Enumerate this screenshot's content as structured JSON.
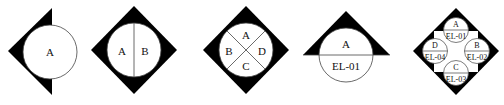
{
  "colors": {
    "fill": "#000000",
    "background": "#ffffff",
    "stroke": "#333333"
  },
  "symbols": [
    {
      "shape": "left-half-diamond-with-circle",
      "labels": [
        "A"
      ]
    },
    {
      "shape": "diamond-with-circle-vertical-split",
      "labels": [
        "A",
        "B"
      ]
    },
    {
      "shape": "diamond-with-circle-x-split",
      "labels": [
        "A",
        "B",
        "C",
        "D"
      ]
    },
    {
      "shape": "triangle-with-circle-horizontal-split",
      "labels": [
        "A",
        "EL-01"
      ]
    },
    {
      "shape": "diamond-with-four-split-circles",
      "circles": [
        {
          "top": "A",
          "bottom": "EL-01"
        },
        {
          "top": "B",
          "bottom": "EL-02"
        },
        {
          "top": "C",
          "bottom": "EL-03"
        },
        {
          "top": "D",
          "bottom": "EL-04"
        }
      ]
    }
  ]
}
